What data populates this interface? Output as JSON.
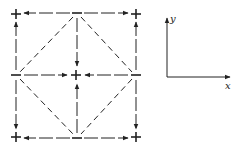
{
  "diagram": {
    "type": "spin-flux / sign pattern lattice",
    "stroke_color": "#222222",
    "background": "#ffffff",
    "nodes": [
      {
        "id": "tl",
        "sign": "+",
        "x": 16,
        "y": 14
      },
      {
        "id": "tm",
        "sign": "−",
        "x": 77,
        "y": 13
      },
      {
        "id": "tr",
        "sign": "+",
        "x": 136,
        "y": 14
      },
      {
        "id": "ml",
        "sign": "−",
        "x": 16,
        "y": 75
      },
      {
        "id": "c",
        "sign": "+",
        "x": 76,
        "y": 75
      },
      {
        "id": "mr",
        "sign": "−",
        "x": 136,
        "y": 75
      },
      {
        "id": "bl",
        "sign": "+",
        "x": 16,
        "y": 137
      },
      {
        "id": "bm",
        "sign": "−",
        "x": 77,
        "y": 138
      },
      {
        "id": "br",
        "sign": "+",
        "x": 136,
        "y": 137
      }
    ],
    "arrows": [
      {
        "from": "tm",
        "to": "tl"
      },
      {
        "from": "tm",
        "to": "tr"
      },
      {
        "from": "tm",
        "to": "c"
      },
      {
        "from": "ml",
        "to": "tl"
      },
      {
        "from": "ml",
        "to": "bl"
      },
      {
        "from": "ml",
        "to": "c"
      },
      {
        "from": "mr",
        "to": "tr"
      },
      {
        "from": "mr",
        "to": "br"
      },
      {
        "from": "mr",
        "to": "c"
      },
      {
        "from": "bm",
        "to": "bl"
      },
      {
        "from": "bm",
        "to": "br"
      },
      {
        "from": "bm",
        "to": "c"
      }
    ],
    "dashed_diamond": [
      "tm",
      "mr",
      "bm",
      "ml"
    ],
    "axes": {
      "x_label": "x",
      "y_label": "y",
      "origin": {
        "x": 167,
        "y": 77
      },
      "x_end": {
        "x": 231,
        "y": 77
      },
      "y_end": {
        "x": 167,
        "y": 17
      }
    }
  }
}
